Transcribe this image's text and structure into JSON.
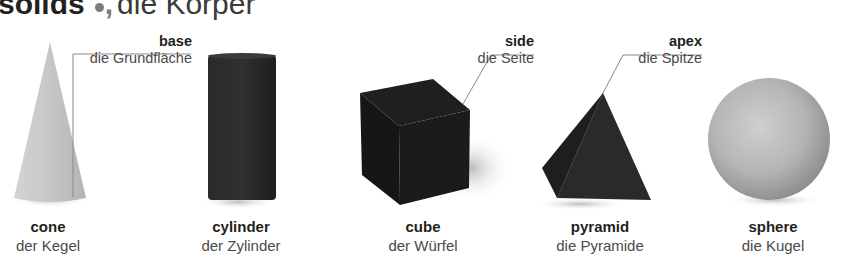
{
  "title": {
    "english": "solids",
    "german": "die Körper"
  },
  "callouts": {
    "base": {
      "english": "base",
      "german": "die Grundfläche"
    },
    "side": {
      "english": "side",
      "german": "die Seite"
    },
    "apex": {
      "english": "apex",
      "german": "die Spitze"
    }
  },
  "solids": [
    {
      "english": "cone",
      "german": "der Kegel"
    },
    {
      "english": "cylinder",
      "german": "der Zylinder"
    },
    {
      "english": "cube",
      "german": "der Würfel"
    },
    {
      "english": "pyramid",
      "german": "die Pyramide"
    },
    {
      "english": "sphere",
      "german": "die Kugel"
    }
  ],
  "colors": {
    "text": "#231f20",
    "bullet": "#7d7d7d",
    "leader_line": "#8a8a8a"
  }
}
